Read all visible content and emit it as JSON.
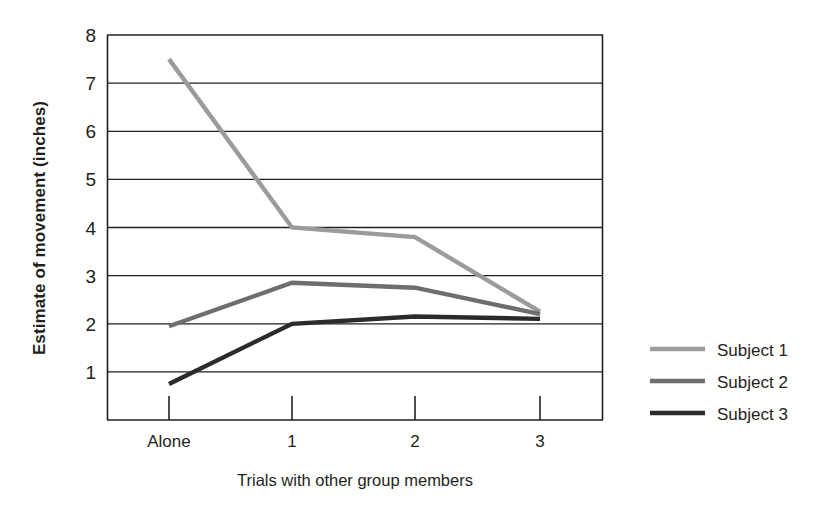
{
  "chart_data": {
    "type": "line",
    "title": "",
    "xlabel": "Trials with other group members",
    "ylabel": "Estimate of movement (inches)",
    "categories": [
      "Alone",
      "1",
      "2",
      "3"
    ],
    "xticklabels": [
      "Alone",
      "1",
      "2",
      "3"
    ],
    "yticklabels": [
      "1",
      "2",
      "3",
      "4",
      "5",
      "6",
      "7",
      "8"
    ],
    "ylim": [
      0,
      8
    ],
    "ytick_values": [
      1,
      2,
      3,
      4,
      5,
      6,
      7,
      8
    ],
    "grid": "horizontal",
    "legend_position": "right",
    "series": [
      {
        "name": "Subject 1",
        "color": "#9b9b9b",
        "values": [
          7.5,
          4.0,
          3.8,
          2.25
        ]
      },
      {
        "name": "Subject 2",
        "color": "#6e6e6e",
        "values": [
          1.95,
          2.85,
          2.75,
          2.2
        ]
      },
      {
        "name": "Subject 3",
        "color": "#2b2b2b",
        "values": [
          0.75,
          2.0,
          2.15,
          2.1
        ]
      }
    ]
  },
  "axes": {
    "y_title": "Estimate of movement (inches)",
    "x_title": "Trials with other group members",
    "y_ticks": [
      "8",
      "7",
      "6",
      "5",
      "4",
      "3",
      "2",
      "1"
    ],
    "x_ticks": [
      "Alone",
      "1",
      "2",
      "3"
    ]
  },
  "legend": {
    "entries": [
      {
        "label": "Subject 1",
        "color": "#9b9b9b"
      },
      {
        "label": "Subject 2",
        "color": "#6e6e6e"
      },
      {
        "label": "Subject 3",
        "color": "#2b2b2b"
      }
    ]
  },
  "colors": {
    "background": "#ffffff",
    "axis": "#231f20",
    "grid": "#231f20",
    "text": "#231f20"
  }
}
